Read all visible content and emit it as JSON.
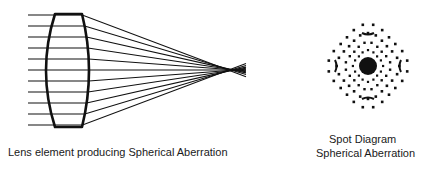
{
  "labels": {
    "lens_caption": "Lens element producing Spherical Aberration",
    "spot_title": "Spot Diagram",
    "spot_subtitle": "Spherical Aberration"
  },
  "lens": {
    "ray_count": 11,
    "ray_start_x": 28,
    "ray_y": [
      15,
      26,
      37,
      48,
      59,
      70,
      81,
      92,
      103,
      114,
      125
    ],
    "top_y": 14,
    "bottom_y": 127,
    "left_edge_x": 55,
    "left_bulge_x": 46,
    "right_edge_x": 82,
    "right_bulge_x": 89,
    "focus_x": 236,
    "focus_y": 70,
    "ray_end_x": 246
  },
  "spot_diagram": {
    "center_x": 368,
    "center_y": 66,
    "core_radius": 9
  },
  "colors": {
    "ink": "#111111",
    "background": "#ffffff"
  }
}
